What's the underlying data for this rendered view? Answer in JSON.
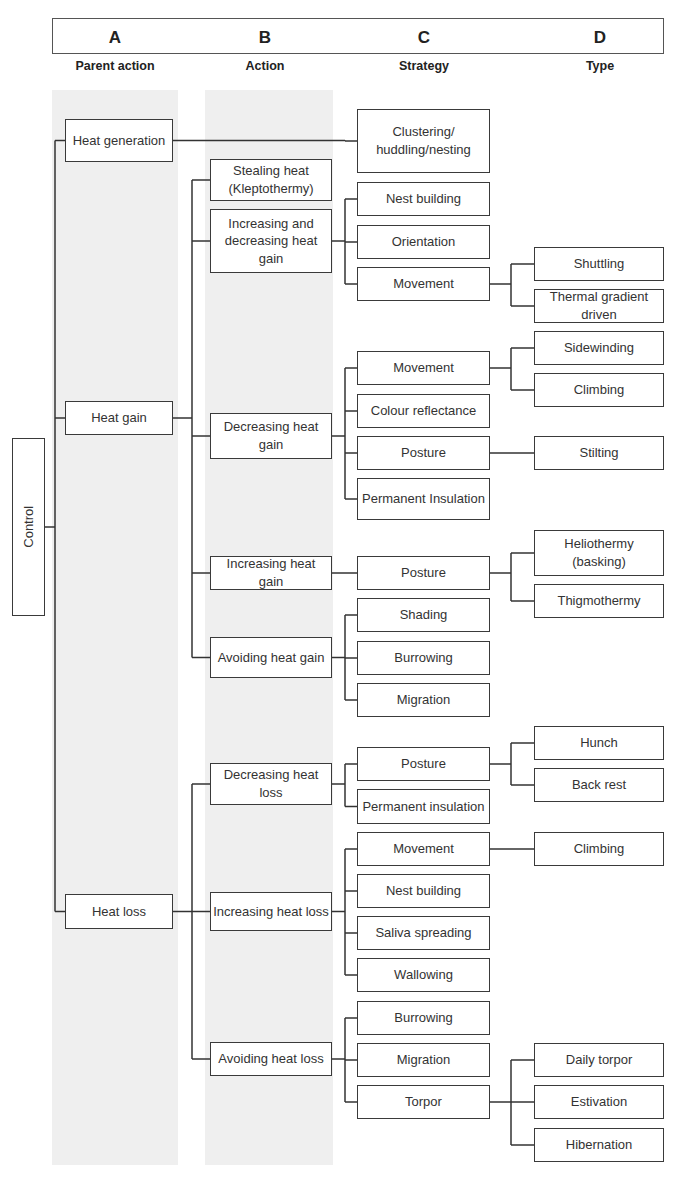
{
  "header": {
    "columns": [
      {
        "letter": "A",
        "label": "Parent action",
        "x": 115
      },
      {
        "letter": "B",
        "label": "Action",
        "x": 265
      },
      {
        "letter": "C",
        "label": "Strategy",
        "x": 424
      },
      {
        "letter": "D",
        "label": "Type",
        "x": 600
      }
    ]
  },
  "colors": {
    "line": "#333333",
    "band": "#efefef",
    "border": "#3a3a3a"
  },
  "bands": [
    {
      "x": 52,
      "y": 90,
      "w": 126,
      "h": 1075
    },
    {
      "x": 205,
      "y": 90,
      "w": 128,
      "h": 1075
    }
  ],
  "root": {
    "label": "Control",
    "x": 12,
    "y": 438,
    "w": 33,
    "h": 178
  },
  "nodes": [
    {
      "id": "a1",
      "label": "Heat generation",
      "x": 65,
      "y": 119,
      "w": 108,
      "h": 43
    },
    {
      "id": "a2",
      "label": "Heat gain",
      "x": 65,
      "y": 401,
      "w": 108,
      "h": 34
    },
    {
      "id": "a3",
      "label": "Heat loss",
      "x": 65,
      "y": 894,
      "w": 108,
      "h": 35
    },
    {
      "id": "b1",
      "label": "Stealing heat (Kleptothermy)",
      "x": 210,
      "y": 159,
      "w": 122,
      "h": 42
    },
    {
      "id": "b2",
      "label": "Increasing and decreasing heat gain",
      "x": 210,
      "y": 209,
      "w": 122,
      "h": 64
    },
    {
      "id": "b3",
      "label": "Decreasing heat gain",
      "x": 210,
      "y": 413,
      "w": 122,
      "h": 46
    },
    {
      "id": "b4",
      "label": "Increasing heat gain",
      "x": 210,
      "y": 556,
      "w": 122,
      "h": 34
    },
    {
      "id": "b5",
      "label": "Avoiding heat gain",
      "x": 210,
      "y": 637,
      "w": 122,
      "h": 41
    },
    {
      "id": "b6",
      "label": "Decreasing heat loss",
      "x": 210,
      "y": 763,
      "w": 122,
      "h": 42
    },
    {
      "id": "b7",
      "label": "Increasing heat loss",
      "x": 210,
      "y": 892,
      "w": 122,
      "h": 39
    },
    {
      "id": "b8",
      "label": "Avoiding heat loss",
      "x": 210,
      "y": 1042,
      "w": 122,
      "h": 34
    },
    {
      "id": "c1",
      "label": "Clustering/ huddling/nesting",
      "x": 357,
      "y": 109,
      "w": 133,
      "h": 64
    },
    {
      "id": "c2",
      "label": "Nest building",
      "x": 357,
      "y": 182,
      "w": 133,
      "h": 34
    },
    {
      "id": "c3",
      "label": "Orientation",
      "x": 357,
      "y": 225,
      "w": 133,
      "h": 34
    },
    {
      "id": "c4",
      "label": "Movement",
      "x": 357,
      "y": 267,
      "w": 133,
      "h": 34
    },
    {
      "id": "c5",
      "label": "Movement",
      "x": 357,
      "y": 351,
      "w": 133,
      "h": 34
    },
    {
      "id": "c6",
      "label": "Colour reflectance",
      "x": 357,
      "y": 394,
      "w": 133,
      "h": 34
    },
    {
      "id": "c7",
      "label": "Posture",
      "x": 357,
      "y": 436,
      "w": 133,
      "h": 34
    },
    {
      "id": "c8",
      "label": "Permanent Insulation",
      "x": 357,
      "y": 478,
      "w": 133,
      "h": 42
    },
    {
      "id": "c9",
      "label": "Posture",
      "x": 357,
      "y": 556,
      "w": 133,
      "h": 34
    },
    {
      "id": "c10",
      "label": "Shading",
      "x": 357,
      "y": 598,
      "w": 133,
      "h": 34
    },
    {
      "id": "c11",
      "label": "Burrowing",
      "x": 357,
      "y": 641,
      "w": 133,
      "h": 34
    },
    {
      "id": "c12",
      "label": "Migration",
      "x": 357,
      "y": 683,
      "w": 133,
      "h": 34
    },
    {
      "id": "c13",
      "label": "Posture",
      "x": 357,
      "y": 747,
      "w": 133,
      "h": 34
    },
    {
      "id": "c14",
      "label": "Permanent insulation",
      "x": 357,
      "y": 789,
      "w": 133,
      "h": 35
    },
    {
      "id": "c15",
      "label": "Movement",
      "x": 357,
      "y": 832,
      "w": 133,
      "h": 34
    },
    {
      "id": "c16",
      "label": "Nest building",
      "x": 357,
      "y": 874,
      "w": 133,
      "h": 34
    },
    {
      "id": "c17",
      "label": "Saliva spreading",
      "x": 357,
      "y": 916,
      "w": 133,
      "h": 34
    },
    {
      "id": "c18",
      "label": "Wallowing",
      "x": 357,
      "y": 958,
      "w": 133,
      "h": 34
    },
    {
      "id": "c19",
      "label": "Burrowing",
      "x": 357,
      "y": 1001,
      "w": 133,
      "h": 34
    },
    {
      "id": "c20",
      "label": "Migration",
      "x": 357,
      "y": 1043,
      "w": 133,
      "h": 34
    },
    {
      "id": "c21",
      "label": "Torpor",
      "x": 357,
      "y": 1085,
      "w": 133,
      "h": 34
    },
    {
      "id": "d1",
      "label": "Shuttling",
      "x": 534,
      "y": 247,
      "w": 130,
      "h": 34
    },
    {
      "id": "d2",
      "label": "Thermal gradient driven",
      "x": 534,
      "y": 289,
      "w": 130,
      "h": 34
    },
    {
      "id": "d3",
      "label": "Sidewinding",
      "x": 534,
      "y": 331,
      "w": 130,
      "h": 34
    },
    {
      "id": "d4",
      "label": "Climbing",
      "x": 534,
      "y": 373,
      "w": 130,
      "h": 34
    },
    {
      "id": "d5",
      "label": "Stilting",
      "x": 534,
      "y": 436,
      "w": 130,
      "h": 34
    },
    {
      "id": "d6",
      "label": "Heliothermy (basking)",
      "x": 534,
      "y": 530,
      "w": 130,
      "h": 46
    },
    {
      "id": "d7",
      "label": "Thigmothermy",
      "x": 534,
      "y": 584,
      "w": 130,
      "h": 34
    },
    {
      "id": "d8",
      "label": "Hunch",
      "x": 534,
      "y": 726,
      "w": 130,
      "h": 34
    },
    {
      "id": "d9",
      "label": "Back rest",
      "x": 534,
      "y": 768,
      "w": 130,
      "h": 34
    },
    {
      "id": "d10",
      "label": "Climbing",
      "x": 534,
      "y": 832,
      "w": 130,
      "h": 34
    },
    {
      "id": "d11",
      "label": "Daily torpor",
      "x": 534,
      "y": 1043,
      "w": 130,
      "h": 34
    },
    {
      "id": "d12",
      "label": "Estivation",
      "x": 534,
      "y": 1085,
      "w": 130,
      "h": 34
    },
    {
      "id": "d13",
      "label": "Hibernation",
      "x": 534,
      "y": 1128,
      "w": 130,
      "h": 34
    }
  ],
  "edges": [
    {
      "from": "root",
      "to": [
        "a1",
        "a2",
        "a3"
      ],
      "bus_x": 55
    },
    {
      "from": "a1",
      "to": [
        "c1"
      ],
      "bus_x": 345
    },
    {
      "from": "a2",
      "to": [
        "b1",
        "b2",
        "b3",
        "b4",
        "b5"
      ],
      "bus_x": 192
    },
    {
      "from": "a3",
      "to": [
        "b6",
        "b7",
        "b8"
      ],
      "bus_x": 192
    },
    {
      "from": "b2",
      "to": [
        "c2",
        "c3",
        "c4"
      ],
      "bus_x": 345
    },
    {
      "from": "b3",
      "to": [
        "c5",
        "c6",
        "c7",
        "c8"
      ],
      "bus_x": 345
    },
    {
      "from": "b4",
      "to": [
        "c9"
      ],
      "bus_x": 345
    },
    {
      "from": "b5",
      "to": [
        "c10",
        "c11",
        "c12"
      ],
      "bus_x": 345
    },
    {
      "from": "b6",
      "to": [
        "c13",
        "c14"
      ],
      "bus_x": 345
    },
    {
      "from": "b7",
      "to": [
        "c15",
        "c16",
        "c17",
        "c18"
      ],
      "bus_x": 345
    },
    {
      "from": "b8",
      "to": [
        "c19",
        "c20",
        "c21"
      ],
      "bus_x": 345
    },
    {
      "from": "c4",
      "to": [
        "d1",
        "d2"
      ],
      "bus_x": 511
    },
    {
      "from": "c5",
      "to": [
        "d3",
        "d4"
      ],
      "bus_x": 511
    },
    {
      "from": "c7",
      "to": [
        "d5"
      ],
      "bus_x": 511
    },
    {
      "from": "c9",
      "to": [
        "d6",
        "d7"
      ],
      "bus_x": 511
    },
    {
      "from": "c13",
      "to": [
        "d8",
        "d9"
      ],
      "bus_x": 511
    },
    {
      "from": "c15",
      "to": [
        "d10"
      ],
      "bus_x": 511
    },
    {
      "from": "c21",
      "to": [
        "d11",
        "d12",
        "d13"
      ],
      "bus_x": 511
    }
  ]
}
